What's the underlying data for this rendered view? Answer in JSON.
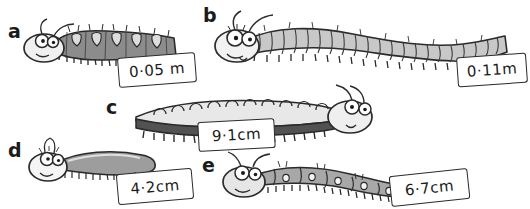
{
  "page": {
    "background_color": "#ffffff",
    "ink_color": "#2a2a2a"
  },
  "items": [
    {
      "key": "a",
      "letter": "a",
      "measurement": "0·05 m",
      "value": 0.05,
      "unit": "m",
      "description": "short stout caterpillar, head left, mid-grey body with pale saddle markings",
      "body_color": "#8c8c8c",
      "marking_color": "#d9d9d9"
    },
    {
      "key": "b",
      "letter": "b",
      "measurement": "0·11m",
      "value": 0.11,
      "unit": "m",
      "description": "long many-segmented caterpillar, head left, pale grey body",
      "body_color": "#c8c8c8",
      "marking_color": "#efefef"
    },
    {
      "key": "c",
      "letter": "c",
      "measurement": "9·1cm",
      "value": 9.1,
      "unit": "cm",
      "description": "caterpillar facing right, pale top with scalloped bumps and dark grey underside",
      "body_color": "#e6e6e6",
      "marking_color": "#555555"
    },
    {
      "key": "d",
      "letter": "d",
      "measurement": "4·2cm",
      "value": 4.2,
      "unit": "cm",
      "description": "small smooth caterpillar, head left, grey tapering body",
      "body_color": "#9d9d9d",
      "marking_color": "#f2f2f2"
    },
    {
      "key": "e",
      "letter": "e",
      "measurement": "6·7cm",
      "value": 6.7,
      "unit": "cm",
      "description": "medium caterpillar, head left, large grey segments each with a small pale spot",
      "body_color": "#a8a8a8",
      "marking_color": "#f2f2f2"
    }
  ]
}
